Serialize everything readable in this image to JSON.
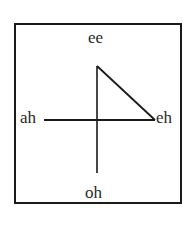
{
  "diagram": {
    "labels": {
      "top": "ee",
      "left": "ah",
      "right": "eh",
      "bottom": "oh"
    },
    "colors": {
      "stroke": "#1a1a1a",
      "text": "#2a2a2a",
      "background": "#ffffff"
    }
  }
}
